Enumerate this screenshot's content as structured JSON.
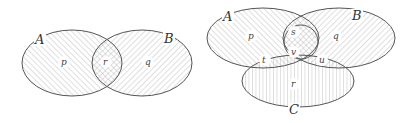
{
  "diagrams": [
    {
      "type": "venn-2",
      "sets": [
        {
          "name": "A",
          "hatch": "backslash"
        },
        {
          "name": "B",
          "hatch": "slash"
        }
      ],
      "regions": [
        {
          "label": "p",
          "set": "A only"
        },
        {
          "label": "r",
          "set": "A ∩ B"
        },
        {
          "label": "q",
          "set": "B only"
        }
      ]
    },
    {
      "type": "venn-3",
      "sets": [
        {
          "name": "A",
          "hatch": "backslash"
        },
        {
          "name": "B",
          "hatch": "slash"
        },
        {
          "name": "C",
          "hatch": "vertical"
        }
      ],
      "regions": [
        {
          "label": "p",
          "set": "A only"
        },
        {
          "label": "q",
          "set": "B only"
        },
        {
          "label": "r",
          "set": "C only"
        },
        {
          "label": "s",
          "set": "A ∩ B only"
        },
        {
          "label": "t",
          "set": "A ∩ C only"
        },
        {
          "label": "u",
          "set": "B ∩ C only"
        },
        {
          "label": "v",
          "set": "A ∩ B ∩ C"
        }
      ]
    }
  ],
  "colors": {
    "outline": "#555555",
    "hatch": "#aaaaaa",
    "background": "#ffffff"
  }
}
